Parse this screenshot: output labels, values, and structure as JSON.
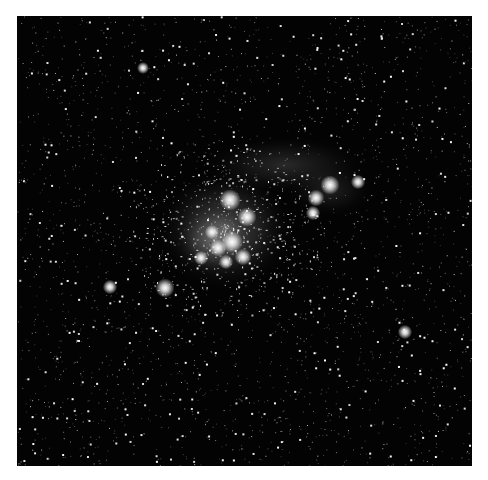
{
  "image": {
    "subject": "star cluster with reflection nebula",
    "background_color": "#030303",
    "border_color": "#ffffff",
    "frame": {
      "x": 17,
      "y": 16,
      "width": 455,
      "height": 450
    }
  },
  "nebula_regions": [
    {
      "cx": 225,
      "cy": 230,
      "rx": 70,
      "ry": 62,
      "opacity": 0.35
    },
    {
      "cx": 215,
      "cy": 240,
      "rx": 40,
      "ry": 36,
      "opacity": 0.35
    },
    {
      "cx": 285,
      "cy": 165,
      "rx": 85,
      "ry": 30,
      "opacity": 0.18
    },
    {
      "cx": 330,
      "cy": 190,
      "rx": 45,
      "ry": 28,
      "opacity": 0.14
    }
  ],
  "bright_stars": [
    {
      "x": 230,
      "y": 200,
      "r": 4.5
    },
    {
      "x": 247,
      "y": 217,
      "r": 4
    },
    {
      "x": 232,
      "y": 242,
      "r": 4.5
    },
    {
      "x": 218,
      "y": 248,
      "r": 3.5
    },
    {
      "x": 243,
      "y": 257,
      "r": 3.5
    },
    {
      "x": 212,
      "y": 232,
      "r": 3
    },
    {
      "x": 226,
      "y": 262,
      "r": 3
    },
    {
      "x": 201,
      "y": 258,
      "r": 3
    },
    {
      "x": 165,
      "y": 288,
      "r": 4
    },
    {
      "x": 330,
      "y": 185,
      "r": 4
    },
    {
      "x": 316,
      "y": 198,
      "r": 3.5
    },
    {
      "x": 358,
      "y": 182,
      "r": 3
    },
    {
      "x": 313,
      "y": 213,
      "r": 3
    },
    {
      "x": 110,
      "y": 287,
      "r": 3
    },
    {
      "x": 143,
      "y": 68,
      "r": 2.5
    },
    {
      "x": 405,
      "y": 332,
      "r": 3
    }
  ],
  "starfield": {
    "count": 2600,
    "seed": 42
  }
}
